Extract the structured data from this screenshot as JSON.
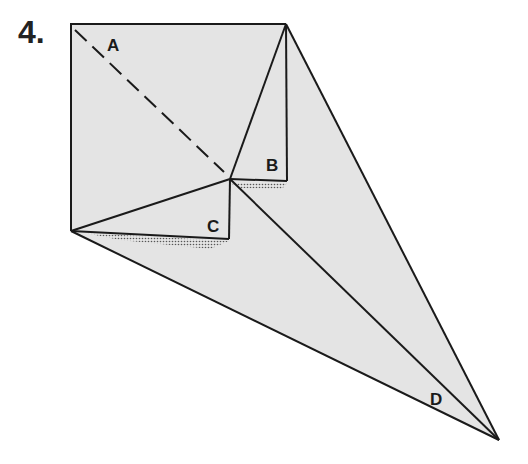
{
  "step": {
    "number": "4."
  },
  "labels": {
    "a": "A",
    "b": "B",
    "c": "C",
    "d": "D"
  },
  "caption": {
    "text": ""
  },
  "colors": {
    "paper": "#e4e4e4",
    "line": "#1a1a1a",
    "background": "#ffffff"
  },
  "icons": [
    "fold-diagram"
  ]
}
